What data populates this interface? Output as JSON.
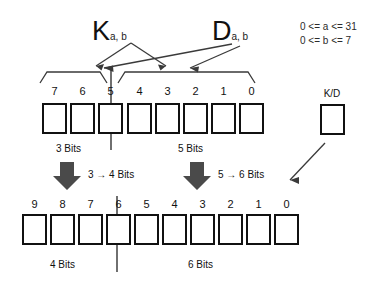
{
  "diagram": {
    "labels": {
      "k": "K",
      "k_sub": "a, b",
      "d": "D",
      "d_sub": "a, b",
      "kd_box": "K/D"
    },
    "constraints": [
      "0 <= a <= 31",
      "0 <= b <= 7"
    ],
    "top_row": {
      "bit_numbers": [
        "7",
        "6",
        "5",
        "4",
        "3",
        "2",
        "1",
        "0"
      ],
      "left_caption": "3 Bits",
      "right_caption": "5 Bits",
      "cell_count": 8
    },
    "transitions": {
      "left": "3 → 4 Bits",
      "right": "5 → 6 Bits"
    },
    "bottom_row": {
      "bit_numbers": [
        "9",
        "8",
        "7",
        "6",
        "5",
        "4",
        "3",
        "2",
        "1",
        "0"
      ],
      "left_caption": "4 Bits",
      "right_caption": "6 Bits",
      "cell_count": 10
    },
    "colors": {
      "ink": "#111111",
      "background": "#ffffff",
      "arrow": "#3a3a3a",
      "thick_arrow": "#4a4a4a"
    }
  }
}
